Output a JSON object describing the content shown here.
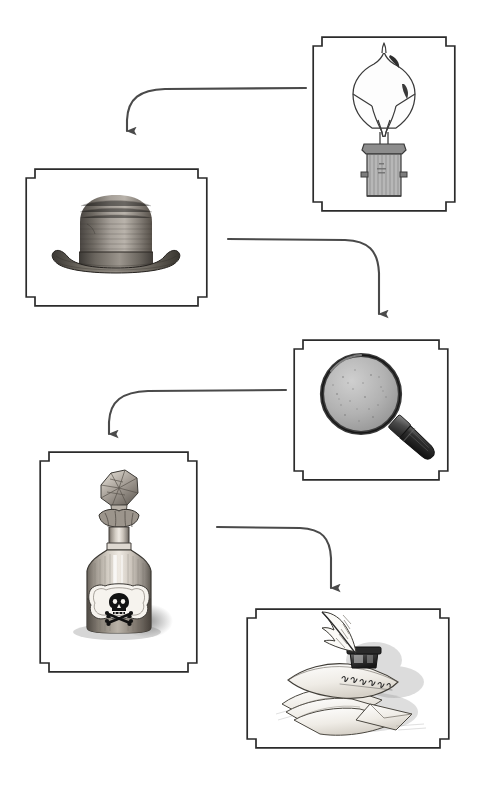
{
  "diagram": {
    "background_color": "#ffffff",
    "ink_color": "#3f3f3f",
    "frame_color": "#2b2b2b",
    "frame_fill": "#ffffff",
    "arrow_color": "#4a4a4a",
    "panel_count": 5,
    "arrow_count": 4,
    "style": "vintage engraving clip-art panels with notched corner frames linked by elbow arrows"
  },
  "panels": [
    {
      "id": "lightbulb",
      "label": "Light Bulb",
      "icon": "lightbulb-icon",
      "caption": "",
      "order": 1,
      "x": 312,
      "y": 36,
      "width": 144,
      "height": 176
    },
    {
      "id": "bowler-hat",
      "label": "Bowler Hat",
      "icon": "bowler-hat-icon",
      "caption": "",
      "order": 2,
      "x": 25,
      "y": 168,
      "width": 183,
      "height": 139
    },
    {
      "id": "magnifying-glass",
      "label": "Magnifying Glass",
      "icon": "magnifying-glass-icon",
      "caption": "",
      "order": 3,
      "x": 293,
      "y": 339,
      "width": 156,
      "height": 142
    },
    {
      "id": "poison-bottle",
      "label": "Poison Bottle",
      "icon": "poison-bottle-icon",
      "caption": "",
      "order": 4,
      "x": 39,
      "y": 451,
      "width": 159,
      "height": 222
    },
    {
      "id": "quill-and-letters",
      "label": "Quill, Inkwell and Letters",
      "icon": "quill-letters-icon",
      "caption": "",
      "order": 5,
      "x": 246,
      "y": 608,
      "width": 204,
      "height": 141
    }
  ],
  "arrows": [
    {
      "id": "arrow-bulb-to-hat",
      "from": "lightbulb",
      "to": "bowler-hat",
      "direction": "down",
      "shape": "elbow-left-down"
    },
    {
      "id": "arrow-hat-to-magnifier",
      "from": "bowler-hat",
      "to": "magnifying-glass",
      "direction": "down",
      "shape": "elbow-right-down"
    },
    {
      "id": "arrow-magnifier-to-bottle",
      "from": "magnifying-glass",
      "to": "poison-bottle",
      "direction": "down",
      "shape": "elbow-left-down"
    },
    {
      "id": "arrow-bottle-to-letters",
      "from": "poison-bottle",
      "to": "quill-and-letters",
      "direction": "down",
      "shape": "elbow-right-down"
    }
  ]
}
